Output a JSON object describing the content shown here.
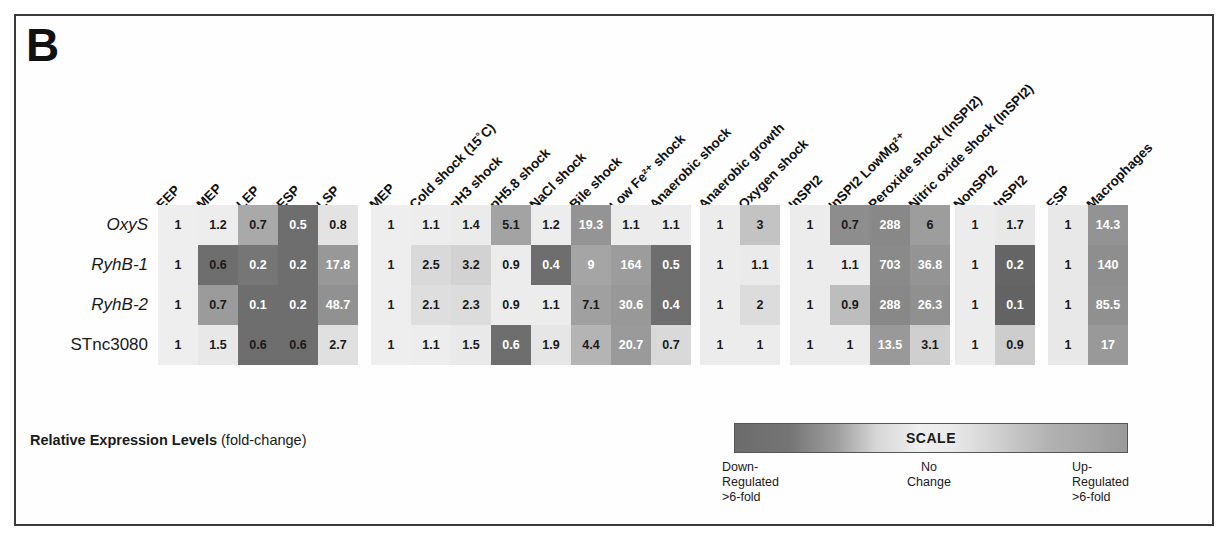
{
  "figure": {
    "panel_letter": "B",
    "legend_caption_bold": "Relative Expression Levels",
    "legend_caption_rest": " (fold-change)"
  },
  "scale": {
    "title": "SCALE",
    "left_line1": "Down-",
    "left_line2": "Regulated",
    "left_line3": ">6-fold",
    "mid_line1": "No",
    "mid_line2": "Change",
    "right_line1": "Up-",
    "right_line2": "Regulated",
    "right_line3": ">6-fold",
    "color_down": "#6c6c6c",
    "color_nochange": "#efefef",
    "color_up": "#9a9a9a"
  },
  "chart_data": {
    "type": "heatmap",
    "title": "Relative Expression Levels (fold-change)",
    "xlabel": "",
    "ylabel": "",
    "rows": [
      "OxyS",
      "RyhB-1",
      "RyhB-2",
      "STnc3080"
    ],
    "row_styles": [
      "italic",
      "italic",
      "italic",
      "normal"
    ],
    "blocks": [
      {
        "name": "growth-phase-block",
        "columns": [
          "EEP",
          "MEP",
          "LEP",
          "ESP",
          "LSP"
        ],
        "values": [
          [
            "1",
            "1.2",
            "0.7",
            "0.5",
            "0.8"
          ],
          [
            "1",
            "0.6",
            "0.2",
            "0.2",
            "17.8"
          ],
          [
            "1",
            "0.7",
            "0.1",
            "0.2",
            "48.7"
          ],
          [
            "1",
            "1.5",
            "0.6",
            "0.6",
            "2.7"
          ]
        ],
        "colors": [
          [
            "#eeeeee",
            "#ededed",
            "#a9a9a9",
            "#6e6e6e",
            "#e3e3e3"
          ],
          [
            "#eeeeee",
            "#6e6e6e",
            "#767676",
            "#6e6e6e",
            "#989898"
          ],
          [
            "#eeeeee",
            "#9b9b9b",
            "#6e6e6e",
            "#6e6e6e",
            "#919191"
          ],
          [
            "#eeeeee",
            "#e8e8e8",
            "#6e6e6e",
            "#6e6e6e",
            "#e0e0e0"
          ]
        ],
        "text_colors": [
          [
            "#1a1a1a",
            "#1a1a1a",
            "#1a1a1a",
            "#ffffff",
            "#1a1a1a"
          ],
          [
            "#1a1a1a",
            "#1a1a1a",
            "#ffffff",
            "#ffffff",
            "#ffffff"
          ],
          [
            "#1a1a1a",
            "#1a1a1a",
            "#ffffff",
            "#ffffff",
            "#ffffff"
          ],
          [
            "#1a1a1a",
            "#1a1a1a",
            "#1a1a1a",
            "#1a1a1a",
            "#1a1a1a"
          ]
        ]
      },
      {
        "name": "stress-shock-block",
        "columns": [
          "MEP",
          "Cold shock (15˚C)",
          "pH3 shock",
          "pH5.8 shock",
          "NaCl shock",
          "Bile shock",
          "Low Fe²⁺ shock",
          "Anaerobic shock"
        ],
        "values": [
          [
            "1",
            "1.1",
            "1.4",
            "5.1",
            "1.2",
            "19.3",
            "1.1",
            "1.1"
          ],
          [
            "1",
            "2.5",
            "3.2",
            "0.9",
            "0.4",
            "9",
            "164",
            "0.5"
          ],
          [
            "1",
            "2.1",
            "2.3",
            "0.9",
            "1.1",
            "7.1",
            "30.6",
            "0.4"
          ],
          [
            "1",
            "1.1",
            "1.5",
            "0.6",
            "1.9",
            "4.4",
            "20.7",
            "0.7"
          ]
        ],
        "colors": [
          [
            "#eeeeee",
            "#ededed",
            "#ebebeb",
            "#a3a3a3",
            "#ededed",
            "#949494",
            "#ececec",
            "#ececec"
          ],
          [
            "#eeeeee",
            "#d9d9d9",
            "#d2d2d2",
            "#ececec",
            "#6e6e6e",
            "#a5a5a5",
            "#9c9c9c",
            "#6e6e6e"
          ],
          [
            "#eeeeee",
            "#dedede",
            "#dcdcdc",
            "#ececec",
            "#ececec",
            "#a0a0a0",
            "#989898",
            "#6e6e6e"
          ],
          [
            "#eeeeee",
            "#ededed",
            "#e9e9e9",
            "#6e6e6e",
            "#e6e6e6",
            "#b4b4b4",
            "#9a9a9a",
            "#d9d9d9"
          ]
        ],
        "text_colors": [
          [
            "#1a1a1a",
            "#1a1a1a",
            "#1a1a1a",
            "#1a1a1a",
            "#1a1a1a",
            "#ffffff",
            "#1a1a1a",
            "#1a1a1a"
          ],
          [
            "#1a1a1a",
            "#1a1a1a",
            "#1a1a1a",
            "#1a1a1a",
            "#ffffff",
            "#ffffff",
            "#ffffff",
            "#ffffff"
          ],
          [
            "#1a1a1a",
            "#1a1a1a",
            "#1a1a1a",
            "#1a1a1a",
            "#1a1a1a",
            "#1a1a1a",
            "#ffffff",
            "#ffffff"
          ],
          [
            "#1a1a1a",
            "#1a1a1a",
            "#1a1a1a",
            "#ffffff",
            "#1a1a1a",
            "#1a1a1a",
            "#ffffff",
            "#1a1a1a"
          ]
        ]
      },
      {
        "name": "anaerobic-oxygen-block",
        "columns": [
          "Anaerobic growth",
          "Oxygen shock"
        ],
        "values": [
          [
            "1",
            "3"
          ],
          [
            "1",
            "1.1"
          ],
          [
            "1",
            "2"
          ],
          [
            "1",
            "1"
          ]
        ],
        "colors": [
          [
            "#ececec",
            "#c3c3c3"
          ],
          [
            "#ececec",
            "#eaeaea"
          ],
          [
            "#ececec",
            "#dcdcdc"
          ],
          [
            "#ececec",
            "#ececec"
          ]
        ],
        "text_colors": [
          [
            "#1a1a1a",
            "#1a1a1a"
          ],
          [
            "#1a1a1a",
            "#1a1a1a"
          ],
          [
            "#1a1a1a",
            "#1a1a1a"
          ],
          [
            "#1a1a1a",
            "#1a1a1a"
          ]
        ]
      },
      {
        "name": "inspi2-block",
        "columns": [
          "InSPI2",
          "InSPI2 LowMg²⁺",
          "Peroxide shock (InSPI2)",
          "Nitric oxide shock (InSPI2)"
        ],
        "values": [
          [
            "1",
            "0.7",
            "288",
            "6"
          ],
          [
            "1",
            "1.1",
            "703",
            "36.8"
          ],
          [
            "1",
            "0.9",
            "288",
            "26.3"
          ],
          [
            "1",
            "1",
            "13.5",
            "3.1"
          ]
        ],
        "colors": [
          [
            "#ececec",
            "#8d8d8d",
            "#888888",
            "#9d9d9d"
          ],
          [
            "#ececec",
            "#ececec",
            "#8a8a8a",
            "#949494"
          ],
          [
            "#ececec",
            "#bdbdbd",
            "#888888",
            "#909090"
          ],
          [
            "#ececec",
            "#ececec",
            "#999999",
            "#cfcfcf"
          ]
        ],
        "text_colors": [
          [
            "#1a1a1a",
            "#1a1a1a",
            "#ffffff",
            "#1a1a1a"
          ],
          [
            "#1a1a1a",
            "#1a1a1a",
            "#ffffff",
            "#ffffff"
          ],
          [
            "#1a1a1a",
            "#1a1a1a",
            "#ffffff",
            "#ffffff"
          ],
          [
            "#1a1a1a",
            "#1a1a1a",
            "#ffffff",
            "#1a1a1a"
          ]
        ]
      },
      {
        "name": "nonspi2-inspi2-block",
        "columns": [
          "NonSPI2",
          "InSPI2"
        ],
        "values": [
          [
            "1",
            "1.7"
          ],
          [
            "1",
            "0.2"
          ],
          [
            "1",
            "0.1"
          ],
          [
            "1",
            "0.9"
          ]
        ],
        "colors": [
          [
            "#ececec",
            "#e8e8e8"
          ],
          [
            "#ececec",
            "#656565"
          ],
          [
            "#ececec",
            "#636363"
          ],
          [
            "#ececec",
            "#cdcdcd"
          ]
        ],
        "text_colors": [
          [
            "#1a1a1a",
            "#1a1a1a"
          ],
          [
            "#1a1a1a",
            "#ffffff"
          ],
          [
            "#1a1a1a",
            "#ffffff"
          ],
          [
            "#1a1a1a",
            "#1a1a1a"
          ]
        ]
      },
      {
        "name": "esp-macrophages-block",
        "columns": [
          "ESP",
          "Macrophages"
        ],
        "values": [
          [
            "1",
            "14.3"
          ],
          [
            "1",
            "140"
          ],
          [
            "1",
            "85.5"
          ],
          [
            "1",
            "17"
          ]
        ],
        "colors": [
          [
            "#e8e8e8",
            "#939393"
          ],
          [
            "#e8e8e8",
            "#8e8e8e"
          ],
          [
            "#e8e8e8",
            "#909090"
          ],
          [
            "#e8e8e8",
            "#999999"
          ]
        ],
        "text_colors": [
          [
            "#1a1a1a",
            "#ffffff"
          ],
          [
            "#1a1a1a",
            "#ffffff"
          ],
          [
            "#1a1a1a",
            "#ffffff"
          ],
          [
            "#1a1a1a",
            "#ffffff"
          ]
        ]
      }
    ],
    "layout": {
      "cell_width": 40,
      "cell_height": 40,
      "row_tops": [
        205,
        245,
        285,
        325
      ],
      "block_lefts": [
        158,
        371,
        700,
        790,
        955,
        1048
      ],
      "grid": "off",
      "legend_position": "bottom-right"
    }
  }
}
